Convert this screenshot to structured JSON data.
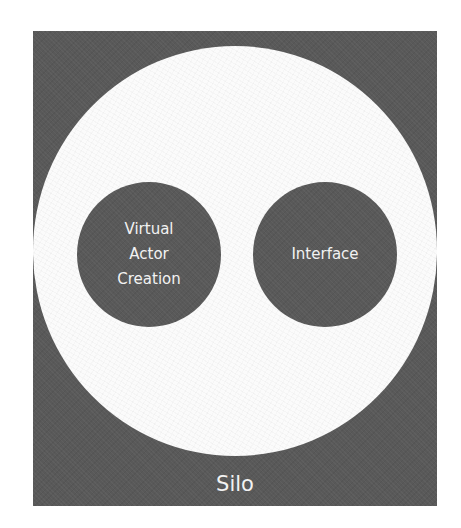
{
  "diagram": {
    "outer": {
      "label": "Silo",
      "fill_color": "#595959"
    },
    "inner_area": {
      "fill_color": "#fbfbfb"
    },
    "nodes": [
      {
        "id": "virtual-actor-creation",
        "lines": [
          "Virtual",
          "Actor",
          "Creation"
        ],
        "fill_color": "#595959",
        "text_color": "#f2f2f2"
      },
      {
        "id": "interface",
        "lines": [
          "Interface"
        ],
        "fill_color": "#595959",
        "text_color": "#f2f2f2"
      }
    ]
  }
}
